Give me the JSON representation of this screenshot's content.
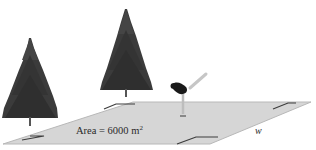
{
  "figure": {
    "area_label": "Area = 6000 m",
    "area_exponent": "2",
    "width_label": "w",
    "elements": [
      "tree-left",
      "tree-middle",
      "skater",
      "rectangular-field"
    ],
    "colors": {
      "background": "#ffffff",
      "field": "#d6d6d6",
      "field_edge": "#bdbdbd",
      "corner_mark": "#3c3c3c",
      "tree": "#3a3a3a",
      "skater_dark": "#1a1a1a",
      "skater_light": "#c8c8c8"
    }
  }
}
